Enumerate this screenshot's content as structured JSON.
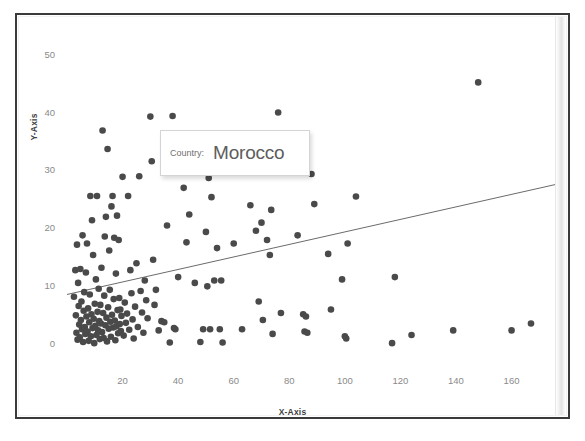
{
  "chart_data": {
    "type": "scatter",
    "title": "",
    "xlabel": "X-Axis",
    "ylabel": "Y-Axis",
    "xlim": [
      0,
      176
    ],
    "ylim": [
      -1.5,
      52
    ],
    "xticks": [
      20,
      40,
      60,
      80,
      100,
      120,
      140,
      160
    ],
    "yticks": [
      0,
      10,
      20,
      30,
      40,
      50
    ],
    "grid": false,
    "legend": null,
    "point_color": "#4a4a4a",
    "trendline_color": "#6b6b6b",
    "trendline": {
      "x0": 0,
      "y0": 8.6,
      "x1": 176,
      "y1": 27.6
    },
    "points": [
      [
        2.5,
        8.2
      ],
      [
        3.0,
        12.8
      ],
      [
        3.2,
        5.0
      ],
      [
        3.4,
        2.0
      ],
      [
        3.6,
        17.2
      ],
      [
        3.8,
        0.8
      ],
      [
        4.0,
        10.6
      ],
      [
        4.2,
        6.6
      ],
      [
        4.4,
        3.4
      ],
      [
        4.6,
        1.2
      ],
      [
        4.8,
        13.0
      ],
      [
        5.0,
        4.2
      ],
      [
        5.2,
        7.4
      ],
      [
        5.4,
        2.6
      ],
      [
        5.6,
        18.8
      ],
      [
        5.8,
        0.4
      ],
      [
        6.0,
        5.8
      ],
      [
        6.2,
        9.0
      ],
      [
        6.4,
        3.0
      ],
      [
        6.6,
        1.8
      ],
      [
        6.8,
        12.4
      ],
      [
        7.0,
        4.8
      ],
      [
        7.2,
        17.4
      ],
      [
        7.4,
        2.2
      ],
      [
        7.6,
        6.2
      ],
      [
        7.8,
        0.6
      ],
      [
        8.0,
        3.8
      ],
      [
        8.2,
        8.6
      ],
      [
        8.4,
        25.6
      ],
      [
        8.6,
        1.4
      ],
      [
        8.8,
        5.2
      ],
      [
        9.0,
        21.4
      ],
      [
        9.2,
        2.8
      ],
      [
        9.4,
        15.4
      ],
      [
        9.6,
        4.4
      ],
      [
        9.8,
        0.2
      ],
      [
        10.0,
        7.0
      ],
      [
        10.2,
        3.2
      ],
      [
        10.4,
        11.2
      ],
      [
        10.6,
        1.6
      ],
      [
        10.8,
        25.6
      ],
      [
        11.0,
        5.6
      ],
      [
        11.2,
        2.4
      ],
      [
        11.4,
        9.6
      ],
      [
        11.6,
        4.0
      ],
      [
        11.8,
        0.9
      ],
      [
        12.0,
        6.8
      ],
      [
        12.2,
        3.6
      ],
      [
        12.4,
        13.2
      ],
      [
        12.6,
        2.1
      ],
      [
        12.8,
        36.9
      ],
      [
        13.0,
        5.4
      ],
      [
        13.2,
        1.1
      ],
      [
        13.4,
        8.4
      ],
      [
        13.6,
        18.6
      ],
      [
        13.8,
        3.3
      ],
      [
        14.0,
        22.0
      ],
      [
        14.2,
        4.6
      ],
      [
        14.4,
        0.5
      ],
      [
        14.6,
        33.7
      ],
      [
        14.8,
        6.4
      ],
      [
        15.0,
        2.7
      ],
      [
        15.2,
        16.2
      ],
      [
        15.4,
        9.4
      ],
      [
        15.6,
        3.9
      ],
      [
        15.8,
        1.3
      ],
      [
        16.0,
        23.8
      ],
      [
        16.2,
        5.1
      ],
      [
        16.4,
        25.6
      ],
      [
        16.6,
        2.9
      ],
      [
        16.8,
        7.8
      ],
      [
        17.0,
        18.4
      ],
      [
        17.2,
        4.1
      ],
      [
        17.4,
        0.7
      ],
      [
        17.6,
        12.2
      ],
      [
        17.8,
        3.1
      ],
      [
        18.0,
        22.2
      ],
      [
        18.2,
        5.9
      ],
      [
        18.4,
        1.9
      ],
      [
        18.6,
        18.0
      ],
      [
        18.8,
        8.0
      ],
      [
        19.0,
        3.5
      ],
      [
        19.2,
        6.0
      ],
      [
        19.4,
        2.3
      ],
      [
        19.6,
        4.9
      ],
      [
        20.0,
        28.9
      ],
      [
        20.4,
        1.5
      ],
      [
        20.8,
        7.2
      ],
      [
        21.2,
        3.7
      ],
      [
        21.6,
        5.3
      ],
      [
        22.0,
        25.6
      ],
      [
        22.4,
        2.5
      ],
      [
        22.8,
        12.8
      ],
      [
        23.2,
        8.8
      ],
      [
        23.6,
        4.3
      ],
      [
        24.0,
        1.0
      ],
      [
        24.5,
        6.5
      ],
      [
        25.0,
        14.0
      ],
      [
        25.5,
        3.0
      ],
      [
        26.0,
        29.0
      ],
      [
        26.5,
        9.2
      ],
      [
        27.0,
        5.5
      ],
      [
        27.5,
        2.0
      ],
      [
        28.0,
        11.0
      ],
      [
        28.5,
        7.6
      ],
      [
        29.0,
        4.5
      ],
      [
        30.0,
        39.3
      ],
      [
        30.5,
        31.6
      ],
      [
        31.0,
        14.6
      ],
      [
        31.5,
        6.8
      ],
      [
        32.0,
        9.4
      ],
      [
        33.0,
        2.4
      ],
      [
        34.0,
        4.0
      ],
      [
        35.0,
        3.8
      ],
      [
        36.0,
        20.5
      ],
      [
        37.0,
        0.3
      ],
      [
        38.0,
        39.4
      ],
      [
        38.5,
        2.8
      ],
      [
        39.0,
        2.6
      ],
      [
        40.0,
        11.6
      ],
      [
        42.0,
        27.0
      ],
      [
        43.0,
        17.6
      ],
      [
        44.0,
        22.4
      ],
      [
        46.0,
        10.6
      ],
      [
        48.0,
        0.4
      ],
      [
        49.0,
        2.6
      ],
      [
        50.0,
        19.4
      ],
      [
        50.5,
        10.0
      ],
      [
        51.0,
        28.7
      ],
      [
        51.5,
        2.6
      ],
      [
        52.0,
        25.4
      ],
      [
        53.0,
        11.0
      ],
      [
        54.0,
        16.6
      ],
      [
        55.0,
        2.6
      ],
      [
        55.5,
        11.0
      ],
      [
        56.0,
        0.3
      ],
      [
        60.0,
        17.4
      ],
      [
        63.0,
        2.6
      ],
      [
        66.0,
        24.0
      ],
      [
        68.0,
        19.6
      ],
      [
        69.0,
        7.4
      ],
      [
        70.0,
        21.0
      ],
      [
        70.5,
        4.2
      ],
      [
        72.0,
        18.0
      ],
      [
        73.0,
        15.4
      ],
      [
        73.5,
        23.2
      ],
      [
        74.0,
        1.8
      ],
      [
        76.0,
        40.0
      ],
      [
        77.0,
        5.4
      ],
      [
        83.0,
        18.8
      ],
      [
        85.0,
        5.2
      ],
      [
        85.5,
        2.2
      ],
      [
        86.0,
        4.8
      ],
      [
        86.5,
        2.0
      ],
      [
        88.0,
        29.4
      ],
      [
        89.0,
        24.2
      ],
      [
        94.0,
        15.6
      ],
      [
        95.0,
        6.0
      ],
      [
        99.0,
        11.2
      ],
      [
        100.0,
        1.4
      ],
      [
        100.5,
        1.0
      ],
      [
        101.0,
        17.4
      ],
      [
        104.0,
        25.5
      ],
      [
        117.0,
        0.2
      ],
      [
        118.0,
        11.6
      ],
      [
        124.0,
        1.6
      ],
      [
        139.0,
        2.4
      ],
      [
        148.0,
        45.2
      ],
      [
        160.0,
        2.4
      ],
      [
        167.0,
        3.6
      ]
    ]
  },
  "tooltip": {
    "key": "Country:",
    "value": "Morocco"
  },
  "axes": {
    "y_title": "Y-Axis",
    "x_title": "X-Axis",
    "y_ticks": [
      "0",
      "10",
      "20",
      "30",
      "40",
      "50"
    ],
    "x_ticks": [
      "20",
      "40",
      "60",
      "80",
      "100",
      "120",
      "140",
      "160"
    ]
  }
}
